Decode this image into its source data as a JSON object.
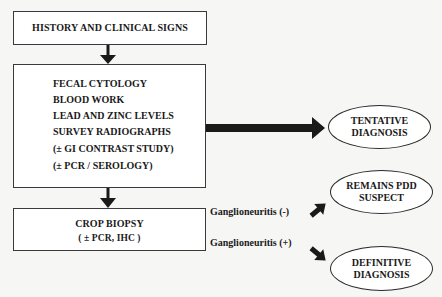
{
  "diagram": {
    "box_history": {
      "text": "HISTORY AND CLINICAL SIGNS"
    },
    "box_tests": {
      "lines": [
        "FECAL CYTOLOGY",
        "BLOOD WORK",
        "LEAD AND ZINC LEVELS",
        "SURVEY RADIOGRAPHS",
        "(± GI CONTRAST STUDY)",
        "(± PCR / SEROLOGY)"
      ]
    },
    "box_biopsy": {
      "line1": "CROP BIOPSY",
      "line2": "( ± PCR, IHC )"
    },
    "outcomes": {
      "tentative": {
        "line1": "TENTATIVE",
        "line2": "DIAGNOSIS"
      },
      "suspect": {
        "line1": "REMAINS PDD",
        "line2": "SUSPECT"
      },
      "definitive": {
        "line1": "DEFINITIVE",
        "line2": "DIAGNOSIS"
      }
    },
    "edge_labels": {
      "negative": "Ganglioneuritis (-)",
      "positive": "Ganglioneuritis (+)"
    },
    "colors": {
      "stroke": "#2a2a2a",
      "arrow": "#1a1a1a",
      "background": "#f6f6f4"
    }
  }
}
